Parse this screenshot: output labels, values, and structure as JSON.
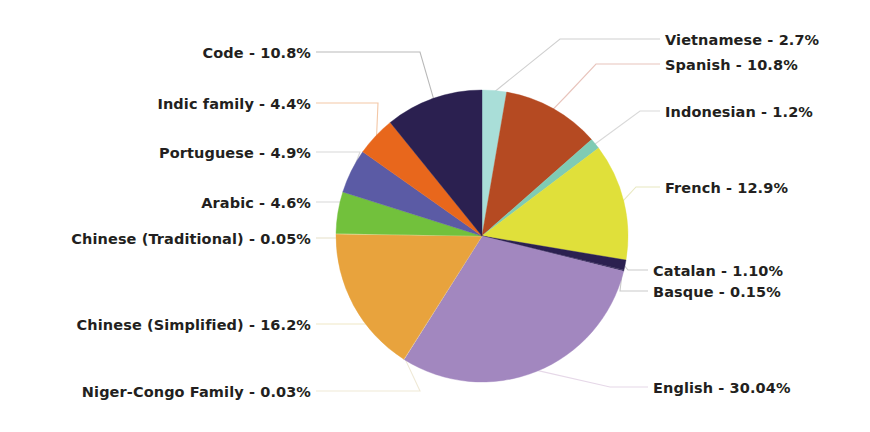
{
  "chart_data": {
    "type": "pie",
    "title": "",
    "subtitle": "",
    "xlabel": "",
    "ylabel": "",
    "legend_position": "callout-labels",
    "grid": false,
    "total_percent": 100.0,
    "start_angle_deg": 0,
    "direction": "clockwise",
    "categories": [
      "Vietnamese",
      "Spanish",
      "Indonesian",
      "French",
      "Catalan",
      "Basque",
      "English",
      "Niger-Congo Family",
      "Chinese (Simplified)",
      "Chinese (Traditional)",
      "Arabic",
      "Portuguese",
      "Indic family",
      "Code"
    ],
    "values": [
      2.7,
      10.8,
      1.2,
      12.9,
      1.1,
      0.15,
      30.04,
      0.03,
      16.2,
      0.05,
      4.6,
      4.9,
      4.4,
      10.8
    ],
    "colors": [
      "#A9DED8",
      "#B54A22",
      "#7FCBB4",
      "#E0E03A",
      "#2B2050",
      "#3A2E5E",
      "#A287BF",
      "#F0EAD0",
      "#E8A33D",
      "#F2E6B0",
      "#72C13C",
      "#5B5BA5",
      "#E8671C",
      "#2B2050"
    ],
    "slices": [
      {
        "label": "Vietnamese",
        "value": 2.7,
        "display": "Vietnamese - 2.7%",
        "color": "#A9DED8"
      },
      {
        "label": "Spanish",
        "value": 10.8,
        "display": "Spanish - 10.8%",
        "color": "#B54A22"
      },
      {
        "label": "Indonesian",
        "value": 1.2,
        "display": "Indonesian - 1.2%",
        "color": "#7FCBB4"
      },
      {
        "label": "French",
        "value": 12.9,
        "display": "French - 12.9%",
        "color": "#E0E03A"
      },
      {
        "label": "Catalan",
        "value": 1.1,
        "display": "Catalan - 1.10%",
        "color": "#2B2050"
      },
      {
        "label": "Basque",
        "value": 0.15,
        "display": "Basque - 0.15%",
        "color": "#3A2E5E"
      },
      {
        "label": "English",
        "value": 30.04,
        "display": "English - 30.04%",
        "color": "#A287BF"
      },
      {
        "label": "Niger-Congo Family",
        "value": 0.03,
        "display": "Niger-Congo Family - 0.03%",
        "color": "#F0EAD0"
      },
      {
        "label": "Chinese (Simplified)",
        "value": 16.2,
        "display": "Chinese (Simplified) - 16.2%",
        "color": "#E8A33D"
      },
      {
        "label": "Chinese (Traditional)",
        "value": 0.05,
        "display": "Chinese (Traditional) - 0.05%",
        "color": "#F2E6B0"
      },
      {
        "label": "Arabic",
        "value": 4.6,
        "display": "Arabic - 4.6%",
        "color": "#72C13C"
      },
      {
        "label": "Portuguese",
        "value": 4.9,
        "display": "Portuguese - 4.9%",
        "color": "#5B5BA5"
      },
      {
        "label": "Indic family",
        "value": 4.4,
        "display": "Indic family - 4.4%",
        "color": "#E8671C"
      },
      {
        "label": "Code",
        "value": 10.8,
        "display": "Code - 10.8%",
        "color": "#2B2050"
      }
    ]
  },
  "geometry": {
    "center_x": 482,
    "center_y": 236,
    "radius": 146
  },
  "labels": {
    "vietnamese": {
      "text": "Vietnamese - 2.7%",
      "x": 665,
      "y": 33,
      "side": "right"
    },
    "spanish": {
      "text": "Spanish - 10.8%",
      "x": 665,
      "y": 58,
      "side": "right"
    },
    "indonesian": {
      "text": "Indonesian - 1.2%",
      "x": 665,
      "y": 105,
      "side": "right"
    },
    "french": {
      "text": "French - 12.9%",
      "x": 665,
      "y": 181,
      "side": "right"
    },
    "catalan": {
      "text": "Catalan - 1.10%",
      "x": 653,
      "y": 264,
      "side": "right"
    },
    "basque": {
      "text": "Basque - 0.15%",
      "x": 653,
      "y": 285,
      "side": "right"
    },
    "english": {
      "text": "English - 30.04%",
      "x": 653,
      "y": 381,
      "side": "right"
    },
    "niger_congo": {
      "text": "Niger-Congo Family - 0.03%",
      "x": 311,
      "y": 385,
      "side": "left"
    },
    "chinese_simplified": {
      "text": "Chinese (Simplified) - 16.2%",
      "x": 311,
      "y": 318,
      "side": "left"
    },
    "chinese_traditional": {
      "text": "Chinese (Traditional) - 0.05%",
      "x": 311,
      "y": 232,
      "side": "left"
    },
    "arabic": {
      "text": "Arabic - 4.6%",
      "x": 311,
      "y": 196,
      "side": "left"
    },
    "portuguese": {
      "text": "Portuguese - 4.9%",
      "x": 311,
      "y": 146,
      "side": "left"
    },
    "indic_family": {
      "text": "Indic family - 4.4%",
      "x": 311,
      "y": 97,
      "side": "left"
    },
    "code": {
      "text": "Code - 10.8%",
      "x": 311,
      "y": 46,
      "side": "left"
    }
  },
  "leader_lines": {
    "code": {
      "color": "#b9b9b9"
    },
    "indic_family": {
      "color": "#f3c7a6"
    },
    "portuguese": {
      "color": "#d8d8d8"
    },
    "arabic": {
      "color": "#d8d8d8"
    },
    "chinese_traditional": {
      "color": "#e6dfc8"
    },
    "chinese_simplified": {
      "color": "#efe7c6"
    },
    "niger_congo": {
      "color": "#efe9d6"
    },
    "english": {
      "color": "#e6d8e8"
    },
    "basque": {
      "color": "#c9c9c9"
    },
    "catalan": {
      "color": "#c9c9c9"
    },
    "french": {
      "color": "#e8e8c0"
    },
    "indonesian": {
      "color": "#d9d9d9"
    },
    "spanish": {
      "color": "#e8c4bc"
    },
    "vietnamese": {
      "color": "#d0d0d0"
    }
  },
  "background": {
    "color": "#ffffff"
  }
}
